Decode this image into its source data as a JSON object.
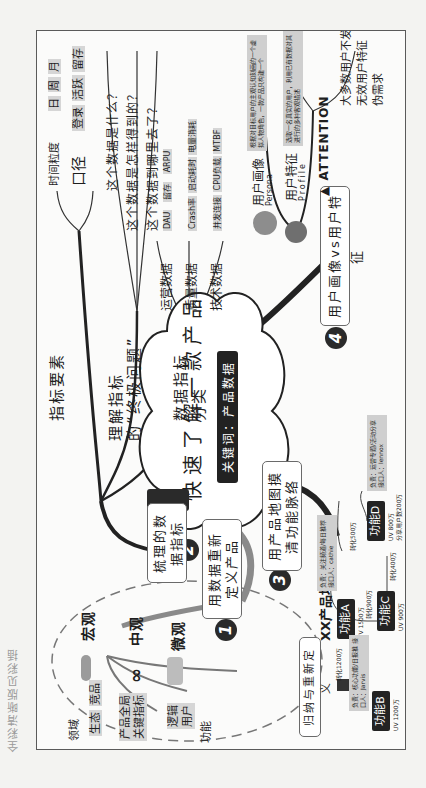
{
  "page": {
    "side_note": "全彩清晰版见彩插"
  },
  "center": {
    "title": "快速了解一款产品",
    "subtitle": "关键词：产品数据"
  },
  "branches": [
    {
      "number": "1",
      "label": "用数据重新定义产品",
      "levels": [
        {
          "name": "宏观",
          "items": [
            "生态",
            "竞品",
            "领域"
          ]
        },
        {
          "name": "中观",
          "items": [
            "产品全局",
            "关键指标"
          ]
        },
        {
          "name": "微观",
          "items": [
            "逻辑",
            "用户",
            "功能"
          ]
        }
      ],
      "summary": "归纳与重新定义"
    },
    {
      "number": "2",
      "label": "梳理的数据指标",
      "children": [
        {
          "name": "指标要素",
          "items": [
            {
              "name": "时间粒度",
              "values": [
                "日",
                "周",
                "月"
              ]
            },
            {
              "name": "口径",
              "values": [
                "登录",
                "活跃",
                "留存"
              ]
            }
          ]
        },
        {
          "name": "理解指标的“终极问题”",
          "items": [
            "这个数据是什么？",
            "这个数据是怎样得到的？",
            "这个数据到哪里去了？"
          ]
        },
        {
          "name": "数据指标分类",
          "items": [
            {
              "name": "运营数据",
              "values": [
                "DAU",
                "留存",
                "ARPU"
              ]
            },
            {
              "name": "质量数据",
              "values": [
                "Crash率",
                "启动耗时",
                "电量消耗"
              ]
            },
            {
              "name": "技术数据",
              "values": [
                "并发连接",
                "CPU负载",
                "MTBF"
              ]
            }
          ]
        }
      ]
    },
    {
      "number": "3",
      "label": "用产品地图摸清功能脉络",
      "product_map": {
        "title": "XX产品地图",
        "nodes": [
          {
            "name": "功能A",
            "uv": "UV 1500万",
            "note": "负责：关注频道/每日推荐  接口人：cathie"
          },
          {
            "name": "功能B",
            "uv": "UV 1200万"
          },
          {
            "name": "功能C",
            "uv": "UV 900万",
            "note": "负责：核心功能/日报推  接口人：Jarvis"
          },
          {
            "name": "功能D",
            "uv": "UV 800万",
            "extra": "分享用户数200万",
            "note": "负责：运营专题/活动分享  接口人：lennox"
          }
        ],
        "edges": [
          {
            "from": "功能A",
            "to": "功能B",
            "label": "转化1200万"
          },
          {
            "from": "功能A",
            "to": "功能C",
            "label": "转化900万"
          },
          {
            "from": "功能A",
            "to": "功能D",
            "label": "转化500万"
          },
          {
            "from": "功能C",
            "to": "功能D",
            "label": "转化400万"
          }
        ]
      }
    },
    {
      "number": "4",
      "label": "用户画像vs用户特征",
      "children": [
        {
          "name": "用户画像",
          "en": "Persona",
          "desc": "根据对目标用户的主观认知刻画的一个虚拟人物角色，一款产品只构建一个"
        },
        {
          "name": "用户特征",
          "en": "Profile",
          "desc": "选取一名真实的用户，利用已有数据对其进行的多种客观描述"
        },
        {
          "name": "ATTENTION",
          "items": [
            "大多数用户不发声",
            "无效用户特征",
            "伪需求"
          ]
        }
      ]
    }
  ]
}
